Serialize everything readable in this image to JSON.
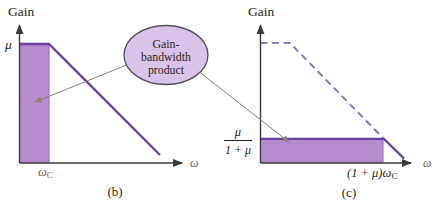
{
  "figure": {
    "background": "#ffffff",
    "callout": {
      "lines": [
        "Gain-",
        "bandwidth",
        "product"
      ],
      "fill": "#d9c3e8",
      "stroke": "#50505e"
    },
    "colors": {
      "shade_fill": "#b58ccd",
      "shade_edge": "#a577c8",
      "curve_solid": "#6a3f9e",
      "curve_dashed": "#9377bf",
      "axis": "#3d3936",
      "label_text": "#2b2722",
      "omega_text": "#6e635a",
      "annotation_line": "#8b8175"
    },
    "plot_b": {
      "caption": "(b)",
      "y_axis_title": "Gain",
      "x_axis_label": "ω",
      "y_tick_label": "μ",
      "x_tick_label": "ω",
      "x_tick_sub": "C"
    },
    "plot_c": {
      "caption": "(c)",
      "y_axis_title": "Gain",
      "x_axis_label": "ω",
      "y_tick_numerator": "μ",
      "y_tick_denominator": "1 + μ",
      "x_tick_label": "(1 + μ)ω",
      "x_tick_sub": "C"
    }
  }
}
